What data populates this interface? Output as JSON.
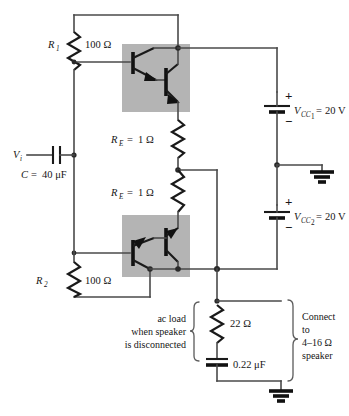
{
  "figure": {
    "type": "schematic",
    "background": "#ffffff",
    "shade_color": "#b4b4b4",
    "wire_color": "#4a4a4a",
    "component_color": "#1a1a1a"
  },
  "components": {
    "r1": {
      "designator": "R",
      "designator_sub": "1",
      "value": "100 Ω",
      "name": "bias-resistor-r1"
    },
    "r2": {
      "designator": "R",
      "designator_sub": "2",
      "value": "100 Ω",
      "name": "bias-resistor-r2"
    },
    "re_upper": {
      "designator": "R",
      "designator_sub": "E",
      "equals": "=",
      "value": "1 Ω",
      "label": "R_E = 1 Ω"
    },
    "re_lower": {
      "designator": "R",
      "designator_sub": "E",
      "equals": "=",
      "value": "1 Ω",
      "label": "R_E = 1 Ω"
    },
    "input_source": {
      "designator": "V",
      "designator_sub": "i"
    },
    "input_cap": {
      "designator": "C",
      "equals": "=",
      "value": "40 μF",
      "label": "C = 40 μF"
    },
    "vcc1": {
      "designator": "V",
      "designator_sub": "CC",
      "designator_sub2": "1",
      "equals": "=",
      "value": "20 V",
      "plus": "+",
      "minus": "−"
    },
    "vcc2": {
      "designator": "V",
      "designator_sub": "CC",
      "designator_sub2": "2",
      "equals": "=",
      "value": "20 V",
      "plus": "+",
      "minus": "−"
    },
    "load_resistor": {
      "value": "22 Ω"
    },
    "load_cap": {
      "value": "0.22 μF"
    }
  },
  "annotations": {
    "ac_load": {
      "line1": "ac load",
      "line2": "when speaker",
      "line3": "is disconnected"
    },
    "speaker": {
      "line1": "Connect",
      "line2": "to",
      "line3": "4–16 Ω",
      "line4": "speaker"
    }
  },
  "transistors": {
    "q1": {
      "type": "npn",
      "role": "upper-darlington-driver"
    },
    "q2": {
      "type": "npn",
      "role": "upper-darlington-output"
    },
    "q3": {
      "type": "pnp",
      "role": "lower-darlington-driver"
    },
    "q4": {
      "type": "pnp",
      "role": "lower-darlington-output"
    }
  },
  "grounds": [
    {
      "name": "supply-ground-upper"
    },
    {
      "name": "output-ground"
    }
  ]
}
